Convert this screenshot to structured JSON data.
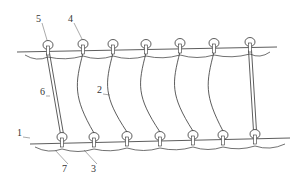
{
  "diagram": {
    "type": "technical-line-drawing",
    "stroke_color": "#333333",
    "background": "#ffffff",
    "top_rail": {
      "from": [
        17,
        52
      ],
      "to": [
        277,
        47
      ]
    },
    "bottom_rail": {
      "from": [
        30,
        144
      ],
      "to": [
        290,
        138
      ]
    },
    "top_rings": [
      [
        48,
        45
      ],
      [
        83,
        44
      ],
      [
        113,
        44
      ],
      [
        146,
        44
      ],
      [
        180,
        43
      ],
      [
        214,
        43
      ],
      [
        250,
        42
      ]
    ],
    "bottom_rings": [
      [
        62,
        137
      ],
      [
        94,
        137
      ],
      [
        127,
        136
      ],
      [
        160,
        136
      ],
      [
        193,
        135
      ],
      [
        223,
        135
      ],
      [
        255,
        134
      ]
    ],
    "labels": [
      {
        "text": "5",
        "x": 36,
        "y": 14,
        "leader_to": [
          47,
          40
        ]
      },
      {
        "text": "4",
        "x": 68,
        "y": 14,
        "leader_to": [
          82,
          39
        ]
      },
      {
        "text": "6",
        "x": 40,
        "y": 87,
        "leader_to": [
          50,
          96
        ]
      },
      {
        "text": "2",
        "x": 97,
        "y": 85,
        "leader_to": [
          110,
          95
        ]
      },
      {
        "text": "1",
        "x": 17,
        "y": 128,
        "leader_to": [
          30,
          138
        ]
      },
      {
        "text": "7",
        "x": 62,
        "y": 164,
        "leader_to": [
          55,
          150
        ]
      },
      {
        "text": "3",
        "x": 91,
        "y": 164,
        "leader_to": [
          84,
          150
        ]
      }
    ]
  }
}
